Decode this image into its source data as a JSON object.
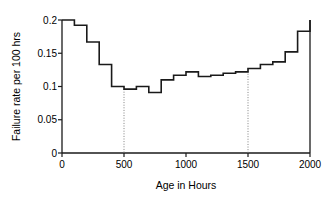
{
  "chart_data": {
    "type": "line",
    "subtype": "step-post",
    "title": "",
    "xlabel": "Age in Hours",
    "ylabel": "Failure rate per 100 hrs",
    "xlim": [
      0,
      2000
    ],
    "ylim": [
      0,
      0.2
    ],
    "xticks": [
      0,
      500,
      1000,
      1500,
      2000
    ],
    "xtick_labels": [
      "0",
      "500",
      "1000",
      "1500",
      "2000"
    ],
    "yticks": [
      0,
      0.05,
      0.1,
      0.15,
      0.2
    ],
    "ytick_labels": [
      "0",
      "0.05",
      "0.1",
      "0.15",
      "0.2"
    ],
    "grid": false,
    "legend": null,
    "series": [
      {
        "name": "Failure rate",
        "color": "#1a1a1a",
        "bin_width": 100,
        "x": [
          0,
          100,
          200,
          300,
          400,
          500,
          600,
          700,
          800,
          900,
          1000,
          1100,
          1200,
          1300,
          1400,
          1500,
          1600,
          1700,
          1800,
          1900,
          2000
        ],
        "values": [
          0.2,
          0.192,
          0.167,
          0.133,
          0.1,
          0.096,
          0.1,
          0.091,
          0.11,
          0.117,
          0.122,
          0.115,
          0.117,
          0.12,
          0.122,
          0.127,
          0.133,
          0.137,
          0.152,
          0.183,
          0.2
        ]
      }
    ],
    "annotations": [
      {
        "name": "marker-500",
        "type": "vline",
        "x": 500,
        "y_top": 0.1,
        "style": "dotted",
        "color": "#808080"
      },
      {
        "name": "marker-1500",
        "type": "vline",
        "x": 1500,
        "y_top": 0.127,
        "style": "dotted",
        "color": "#808080"
      }
    ],
    "axis_color": "#1a1a1a",
    "background": "#ffffff"
  },
  "labels": {
    "x_axis_title": "Age in Hours",
    "y_axis_title": "Failure rate per 100 hrs",
    "x_tick_0": "0",
    "x_tick_1": "500",
    "x_tick_2": "1000",
    "x_tick_3": "1500",
    "x_tick_4": "2000",
    "y_tick_0": "0",
    "y_tick_1": "0.05",
    "y_tick_2": "0.1",
    "y_tick_3": "0.15",
    "y_tick_4": "0.2"
  }
}
